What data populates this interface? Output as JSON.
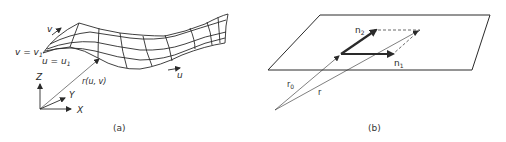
{
  "figure_a": {
    "caption": "(a)",
    "labels": {
      "v_arrow": "v",
      "v_eq": "v = v",
      "v_eq_sub": "1",
      "u_eq": "u = u",
      "u_eq_sub": "1",
      "r_uv": "r(u, v)",
      "u_arrow": "u",
      "axis_z": "Z",
      "axis_y": "Y",
      "axis_x": "X"
    }
  },
  "figure_b": {
    "caption": "(b)",
    "labels": {
      "n2": "n",
      "n2_sub": "2",
      "n1": "n",
      "n1_sub": "1",
      "r0": "r",
      "r0_sub": "0",
      "r": "r"
    }
  },
  "colors": {
    "line": "#2a2a2a",
    "background": "#ffffff"
  }
}
